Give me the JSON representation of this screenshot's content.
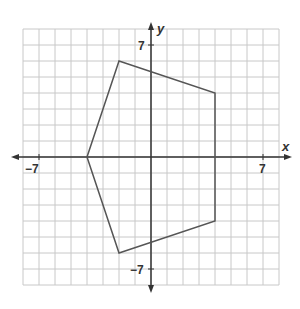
{
  "figure": {
    "type": "coordinate-plane-polygon",
    "x_axis_label": "x",
    "y_axis_label": "y",
    "grid": {
      "xmin": -8,
      "xmax": 8,
      "ymin": -8,
      "ymax": 8,
      "step": 1
    },
    "tick_labels": {
      "x_neg": "−7",
      "x_pos": "7",
      "y_pos": "7",
      "y_neg": "−7"
    },
    "polygon": {
      "vertices": [
        [
          -2,
          6
        ],
        [
          4,
          4
        ],
        [
          4,
          -4
        ],
        [
          -2,
          -6
        ],
        [
          -4,
          0
        ]
      ],
      "stroke": "#555555"
    },
    "colors": {
      "grid": "#c8c8c8",
      "axis": "#333333"
    }
  }
}
